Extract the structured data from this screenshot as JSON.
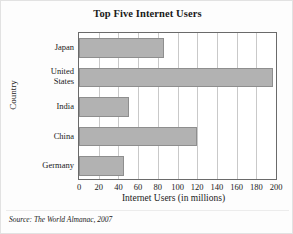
{
  "figure": {
    "title": "Top Five Internet Users",
    "source_note": "Source: The World Almanac, 2007"
  },
  "axes": {
    "y_title": "Country",
    "x_title": "Internet Users (in millions)"
  },
  "colors": {
    "bar_fill": "#b2b2b2",
    "bar_edge": "#8e8e8e",
    "gridline": "#c9c9c9",
    "frame": "#6a6a6a",
    "background": "#fdfdfd"
  },
  "chart_data": {
    "type": "bar",
    "orientation": "horizontal",
    "title": "Top Five Internet Users",
    "xlabel": "Internet Users (in millions)",
    "ylabel": "Country",
    "categories": [
      "Japan",
      "United States",
      "India",
      "China",
      "Germany"
    ],
    "values": [
      86,
      197,
      51,
      120,
      46
    ],
    "xlim": [
      0,
      200
    ],
    "xticks": [
      0,
      20,
      40,
      60,
      80,
      100,
      120,
      140,
      160,
      180,
      200
    ],
    "xtick_labels": [
      "0",
      "20",
      "40",
      "60",
      "80",
      "100",
      "120",
      "140",
      "160",
      "180",
      "200"
    ],
    "grid": "vertical",
    "legend": null,
    "source": "The World Almanac, 2007"
  }
}
